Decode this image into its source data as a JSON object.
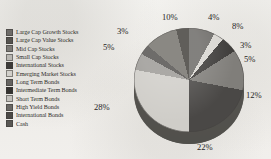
{
  "chart_data": {
    "type": "pie",
    "title": "",
    "subtitle": "",
    "xlabel": "",
    "ylabel": "",
    "legend_position": "left",
    "grid": false,
    "units": "percent",
    "categories": [
      "Large Cap Growth Stocks",
      "Large Cap Value Stocks",
      "Mid Cap Stocks",
      "Small Cap Stocks",
      "International Stocks",
      "Emerging Market Stocks",
      "Long Term Bonds",
      "Intermediate Term Bonds",
      "Short Term Bonds",
      "High Yield Bonds",
      "International Bonds",
      "Cash"
    ],
    "values": [
      8,
      3,
      5,
      12,
      22,
      28,
      5,
      3,
      10,
      4,
      0,
      0
    ],
    "labels": [
      "8%",
      "3%",
      "5%",
      "12%",
      "22%",
      "28%",
      "5%",
      "3%",
      "10%",
      "4%"
    ],
    "colors": [
      "#6e6c69",
      "#d9d7d2",
      "#3d3b39",
      "#807e7a",
      "#4a4846",
      "#cfcdc8",
      "#9d9b97",
      "#565452",
      "#77756f",
      "#46443f",
      "#8f8d88",
      "#605e5a"
    ],
    "slice_labels": [
      {
        "text": "10%",
        "x": 40,
        "y": 0
      },
      {
        "text": "4%",
        "x": 86,
        "y": 0
      },
      {
        "text": "8%",
        "x": 110,
        "y": 9
      },
      {
        "text": "3%",
        "x": 118,
        "y": 28
      },
      {
        "text": "5%",
        "x": 122,
        "y": 42
      },
      {
        "text": "12%",
        "x": 124,
        "y": 78
      },
      {
        "text": "22%",
        "x": 75,
        "y": 130
      },
      {
        "text": "28%",
        "x": -28,
        "y": 90
      },
      {
        "text": "5%",
        "x": -19,
        "y": 30
      },
      {
        "text": "3%",
        "x": -5,
        "y": 14
      }
    ]
  },
  "legend": {
    "items": [
      {
        "label": "Large Cap Growth Stocks",
        "color": "#6e6c69"
      },
      {
        "label": "Large Cap Value Stocks",
        "color": "#55534f"
      },
      {
        "label": "Mid Cap Stocks",
        "color": "#7c7a76"
      },
      {
        "label": "Small Cap Stocks",
        "color": "#b9b7b2"
      },
      {
        "label": "International Stocks",
        "color": "#3d3b39"
      },
      {
        "label": "Emerging Market Stocks",
        "color": "#d2d0cb"
      },
      {
        "label": "Long Term Bonds",
        "color": "#656360"
      },
      {
        "label": "Intermediate Term Bonds",
        "color": "#343230"
      },
      {
        "label": "Short Term Bonds",
        "color": "#c3c1bc"
      },
      {
        "label": "High Yield Bonds",
        "color": "#6a6865"
      },
      {
        "label": "International Bonds",
        "color": "#4c4a47"
      },
      {
        "label": "Cash",
        "color": "#595754"
      }
    ]
  }
}
